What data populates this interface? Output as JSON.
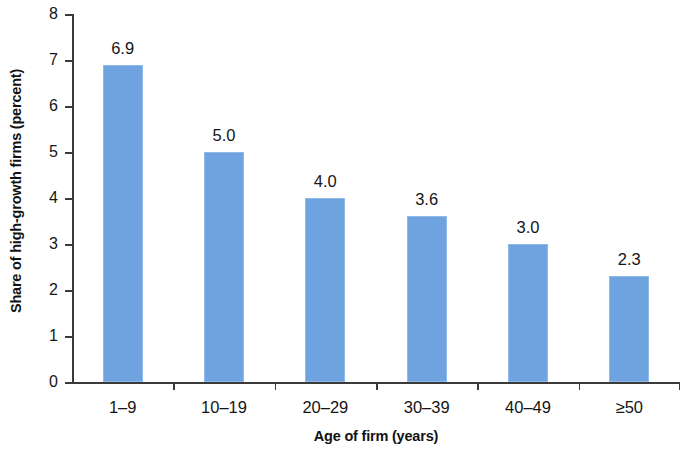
{
  "chart_data": {
    "type": "bar",
    "title": "",
    "subtitle": "",
    "xlabel": "Age of firm (years)",
    "ylabel": "Share of high-growth firms (percent)",
    "categories": [
      "1–9",
      "10–19",
      "20–29",
      "30–39",
      "40–49",
      "≥50"
    ],
    "values": [
      6.9,
      5.0,
      4.0,
      3.6,
      3.0,
      2.3
    ],
    "value_labels": [
      "6.9",
      "5.0",
      "4.0",
      "3.6",
      "3.0",
      "2.3"
    ],
    "ylim": [
      0,
      8
    ],
    "ytick_values": [
      0,
      1,
      2,
      3,
      4,
      5,
      6,
      7,
      8
    ],
    "ytick_labels": [
      "0",
      "1",
      "2",
      "3",
      "4",
      "5",
      "6",
      "7",
      "8"
    ],
    "grid": false,
    "legend": null,
    "bar_color": "#6fa3e0",
    "bar_edge_color": "#8fb9e8",
    "axis_color": "#3a3a3a",
    "text_color": "#151515",
    "background_color": "#ffffff"
  }
}
